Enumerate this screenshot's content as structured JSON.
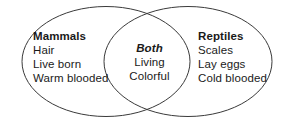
{
  "diagram": {
    "type": "venn-two-set",
    "background_color": "#ffffff",
    "stroke_color": "#3a3a3a",
    "text_color": "#1a1a1a",
    "left_set": {
      "heading": "Mammals",
      "items": [
        "Hair",
        "Live born",
        "Warm blooded"
      ]
    },
    "intersection_set": {
      "heading": "Both",
      "items": [
        "Living",
        "Colorful"
      ]
    },
    "right_set": {
      "heading": "Reptiles",
      "items": [
        "Scales",
        "Lay eggs",
        "Cold blooded"
      ]
    }
  }
}
